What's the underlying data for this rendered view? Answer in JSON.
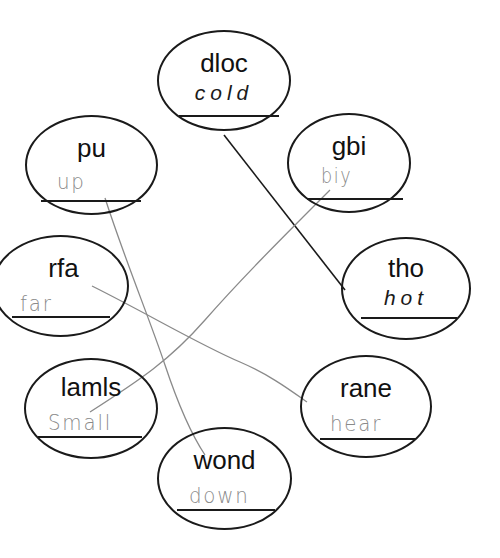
{
  "worksheet": {
    "nodes": [
      {
        "id": "dloc",
        "scrambled": "dloc",
        "answer": "cold",
        "answer_style": "printed"
      },
      {
        "id": "pu",
        "scrambled": "pu",
        "answer": "up",
        "answer_style": "handwritten"
      },
      {
        "id": "gbi",
        "scrambled": "gbi",
        "answer": "big",
        "answer_style": "handwritten"
      },
      {
        "id": "rfa",
        "scrambled": "rfa",
        "answer": "far",
        "answer_style": "handwritten"
      },
      {
        "id": "tho",
        "scrambled": "tho",
        "answer": "hot",
        "answer_style": "printed"
      },
      {
        "id": "lamls",
        "scrambled": "lamls",
        "answer": "Small",
        "answer_style": "handwritten"
      },
      {
        "id": "rane",
        "scrambled": "rane",
        "answer": "near",
        "answer_style": "handwritten"
      },
      {
        "id": "wond",
        "scrambled": "wond",
        "answer": "down",
        "answer_style": "handwritten"
      }
    ],
    "handwritten_display": {
      "pu": "up",
      "gbi": "biy",
      "rfa": "far",
      "lamls": "Small",
      "rane": "hear",
      "wond": "down"
    },
    "connections": [
      {
        "from": "dloc",
        "to": "tho",
        "style": "dark"
      },
      {
        "from": "gbi",
        "to": "lamls",
        "style": "pencil"
      },
      {
        "from": "pu",
        "to": "wond",
        "style": "pencil"
      },
      {
        "from": "rfa",
        "to": "rane",
        "style": "pencil"
      }
    ],
    "colors": {
      "ink": "#1a1a1a",
      "pencil": "#8a8a8a",
      "background": "#ffffff"
    }
  }
}
